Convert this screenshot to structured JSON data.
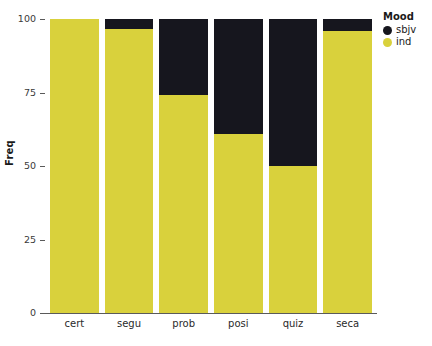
{
  "chart_data": {
    "type": "bar",
    "stacked": true,
    "title": "",
    "xlabel": "",
    "ylabel": "Freq",
    "ylim": [
      0,
      100
    ],
    "yticks": [
      0,
      25,
      50,
      75,
      100
    ],
    "ytick_labels": [
      "0",
      "25",
      "50",
      "75",
      "100"
    ],
    "grid": false,
    "categories": [
      "cert",
      "segu",
      "prob",
      "posi",
      "quiz",
      "seca"
    ],
    "series": [
      {
        "name": "sbjv",
        "color": "#16161e",
        "values": [
          0,
          3.5,
          26,
          39,
          50,
          4
        ]
      },
      {
        "name": "ind",
        "color": "#d9d13c",
        "values": [
          100,
          96.5,
          74,
          61,
          50,
          96
        ]
      }
    ],
    "legend": {
      "title": "Mood",
      "position": "right-top",
      "entries": [
        {
          "label": "sbjv",
          "color": "#16161e"
        },
        {
          "label": "ind",
          "color": "#d9d13c"
        }
      ]
    }
  },
  "colors": {
    "ind": "#d9d13c",
    "sbjv": "#16161e",
    "axis": "#5a5a5a",
    "background": "#ffffff"
  }
}
